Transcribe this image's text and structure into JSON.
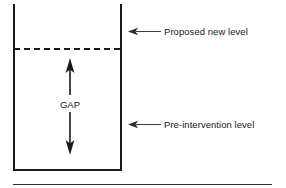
{
  "figure": {
    "type": "gap-analysis-diagram",
    "container": {
      "name": "vessel-box",
      "left_wall_x": 13,
      "right_wall_x": 121,
      "top_y": 4,
      "bottom_y": 170,
      "stroke_color": "#1a1a1a",
      "open_top": true
    },
    "levels": [
      {
        "id": "proposed",
        "label": "Proposed new level",
        "style": "dashed",
        "y": 48,
        "color": "#1a1a1a"
      },
      {
        "id": "pre_intervention",
        "label": "Pre-intervention level",
        "style": "solid-wall-reference",
        "y": 124,
        "color": "#1a1a1a"
      }
    ],
    "gap": {
      "label": "GAP",
      "arrow_up": {
        "from_y": 95,
        "to_y": 60
      },
      "arrow_down": {
        "from_y": 112,
        "to_y": 155
      },
      "shaft_x": 70,
      "color": "#1a1a1a"
    },
    "callouts": [
      {
        "id": "callout-proposed",
        "text": "Proposed new level",
        "arrow_y": 32,
        "arrow_tip_x": 128,
        "arrow_tail_x": 160,
        "text_x": 164,
        "color": "#3d3d3d"
      },
      {
        "id": "callout-pre-intervention",
        "text": "Pre-intervention level",
        "arrow_y": 124,
        "arrow_tip_x": 128,
        "arrow_tail_x": 160,
        "text_x": 164,
        "color": "#3d3d3d"
      }
    ],
    "footer_rule": {
      "x1": 13,
      "x2": 272,
      "y": 184,
      "color": "#2b2b2b"
    },
    "colors": {
      "ink": "#1a1a1a",
      "callout": "#3d3d3d",
      "background": "#ffffff"
    }
  }
}
